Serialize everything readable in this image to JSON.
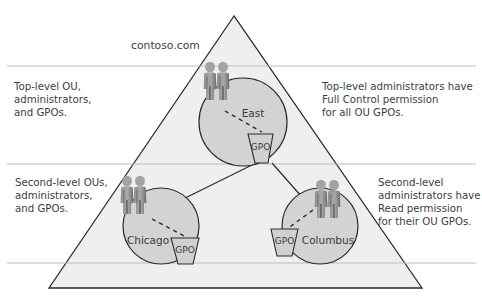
{
  "diagram": {
    "domain_label": "contoso.com",
    "levels": [
      {
        "id": "top-level",
        "left_text": "Top-level OU,\nadministrators,\nand GPOs.",
        "right_text": "Top-level administrators have\nFull Control permission\nfor all OU GPOs."
      },
      {
        "id": "second-level",
        "left_text": "Second-level OUs,\nadministrators,\nand GPOs.",
        "right_text": "Second-level\nadministrators have\nRead permission\nfor their OU GPOs."
      }
    ],
    "ous": [
      {
        "name": "East",
        "gpo_label": "GPO"
      },
      {
        "name": "Chicago",
        "gpo_label": "GPO"
      },
      {
        "name": "Columbus",
        "gpo_label": "GPO"
      }
    ],
    "colors": {
      "triangle_fill": "#efefef",
      "triangle_stroke": "#2b2b2b",
      "circle_fill": "#d3d3d3",
      "divider": "#bdbdbd",
      "person_light": "#9a9a9a",
      "person_dark": "#6a6a6a",
      "gpo_fill": "#d0d0d0"
    }
  }
}
